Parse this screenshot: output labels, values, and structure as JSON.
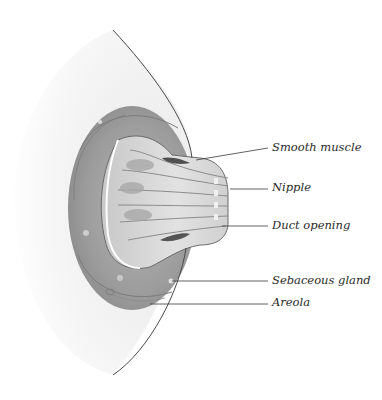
{
  "diagram": {
    "colors": {
      "background": "#ffffff",
      "breast_outline": "#4a4a4a",
      "skin_shading": "#eeeeee",
      "areola_dark": "#8a8a8a",
      "areola_mid": "#a5a5a5",
      "duct_light": "#d8d8d8",
      "leader_line": "#3a3a3a",
      "label_text": "#2a2a2a"
    },
    "labels": [
      {
        "id": "smooth-muscle",
        "text": "Smooth muscle",
        "x": 272,
        "y": 148,
        "pointer": [
          196,
          160
        ]
      },
      {
        "id": "nipple",
        "text": "Nipple",
        "x": 272,
        "y": 188,
        "pointer": [
          230,
          189
        ]
      },
      {
        "id": "duct-opening",
        "text": "Duct opening",
        "x": 272,
        "y": 227,
        "pointer": [
          222,
          226
        ]
      },
      {
        "id": "sebaceous-gland",
        "text": "Sebaceous gland",
        "x": 272,
        "y": 282,
        "pointer": [
          172,
          281
        ]
      },
      {
        "id": "areola",
        "text": "Areola",
        "x": 272,
        "y": 304,
        "pointer": [
          150,
          304
        ]
      }
    ]
  }
}
